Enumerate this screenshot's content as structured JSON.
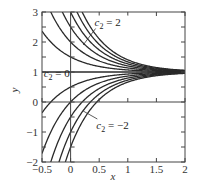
{
  "chart_data": {
    "type": "line",
    "title": "",
    "xlabel": "x",
    "ylabel": "y",
    "xlim": [
      -0.5,
      2
    ],
    "ylim": [
      -2,
      3
    ],
    "xticks": [
      -0.5,
      0,
      0.5,
      1,
      1.5,
      2
    ],
    "xtick_labels": [
      "−0.5",
      "0",
      "0.5",
      "1",
      "1.5",
      "2"
    ],
    "yticks": [
      -2,
      -1,
      0,
      1,
      2,
      3
    ],
    "ytick_labels": [
      "−2",
      "−1",
      "0",
      "1",
      "2",
      "3"
    ],
    "grid": false,
    "reference_lines": {
      "x": 0,
      "y": 0
    },
    "family": "y = 1 + c2*exp(-2x)",
    "series": [
      {
        "name": "c2=3",
        "c2": 3
      },
      {
        "name": "c2=2.5",
        "c2": 2.5
      },
      {
        "name": "c2=2",
        "c2": 2
      },
      {
        "name": "c2=1.5",
        "c2": 1.5
      },
      {
        "name": "c2=1",
        "c2": 1
      },
      {
        "name": "c2=0.5",
        "c2": 0.5
      },
      {
        "name": "c2=0",
        "c2": 0
      },
      {
        "name": "c2=-0.5",
        "c2": -0.5
      },
      {
        "name": "c2=-1",
        "c2": -1
      },
      {
        "name": "c2=-1.5",
        "c2": -1.5
      },
      {
        "name": "c2=-2",
        "c2": -2
      },
      {
        "name": "c2=-2.5",
        "c2": -2.5
      }
    ],
    "annotations": [
      {
        "text_main": "c",
        "text_sub": "2",
        "text_rest": " = 2",
        "x": 0.42,
        "y": 2.55,
        "arrow_to": [
          0.22,
          1.9
        ]
      },
      {
        "text_main": "c",
        "text_sub": "2",
        "text_rest": " = 0",
        "x": -0.47,
        "y": 0.82
      },
      {
        "text_main": "c",
        "text_sub": "2",
        "text_rest": " = −2",
        "x": 0.45,
        "y": -0.9,
        "arrow_to": [
          0.22,
          -0.3
        ]
      }
    ],
    "legend": null
  }
}
